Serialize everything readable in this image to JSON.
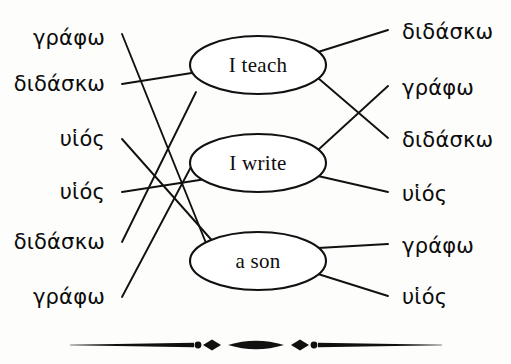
{
  "diagram": {
    "ink_color": "#111111",
    "background_color": "#fdfdfb",
    "nodes": [
      {
        "id": "teach",
        "label": "I teach",
        "cx": 258,
        "cy": 65,
        "rx": 68,
        "ry": 29
      },
      {
        "id": "write",
        "label": "I write",
        "cx": 258,
        "cy": 163,
        "rx": 68,
        "ry": 29
      },
      {
        "id": "son",
        "label": "a son",
        "cx": 258,
        "cy": 261,
        "rx": 68,
        "ry": 29
      }
    ],
    "left_words": [
      {
        "text": "γράφω",
        "x": 105,
        "y": 38
      },
      {
        "text": "διδάσκω",
        "x": 105,
        "y": 84
      },
      {
        "text": "υἱός",
        "x": 105,
        "y": 139
      },
      {
        "text": "υἱός",
        "x": 105,
        "y": 192
      },
      {
        "text": "διδάσκω",
        "x": 105,
        "y": 242
      },
      {
        "text": "γράφω",
        "x": 105,
        "y": 297
      }
    ],
    "right_words": [
      {
        "text": "διδάσκω",
        "x": 402,
        "y": 32
      },
      {
        "text": "γράφω",
        "x": 402,
        "y": 88
      },
      {
        "text": "διδάσκω",
        "x": 402,
        "y": 140
      },
      {
        "text": "υἱός",
        "x": 402,
        "y": 194
      },
      {
        "text": "γράφω",
        "x": 402,
        "y": 246
      },
      {
        "text": "υἱός",
        "x": 402,
        "y": 297
      }
    ],
    "connectors": [
      {
        "from": "left-word-1",
        "to": "node-son",
        "x1": 122,
        "y1": 34,
        "x2": 208,
        "y2": 248
      },
      {
        "from": "left-word-2",
        "to": "node-teach",
        "x1": 122,
        "y1": 84,
        "x2": 198,
        "y2": 72
      },
      {
        "from": "left-word-3",
        "to": "node-son",
        "x1": 122,
        "y1": 139,
        "x2": 216,
        "y2": 245
      },
      {
        "from": "left-word-4",
        "to": "node-write",
        "x1": 122,
        "y1": 192,
        "x2": 219,
        "y2": 177
      },
      {
        "from": "left-word-5",
        "to": "node-teach",
        "x1": 122,
        "y1": 242,
        "x2": 196,
        "y2": 92
      },
      {
        "from": "left-word-6",
        "to": "node-write",
        "x1": 122,
        "y1": 297,
        "x2": 201,
        "y2": 148
      },
      {
        "from": "node-teach",
        "to": "right-word-1",
        "x1": 318,
        "y1": 52,
        "x2": 388,
        "y2": 30
      },
      {
        "from": "node-teach",
        "to": "right-word-3",
        "x1": 318,
        "y1": 78,
        "x2": 388,
        "y2": 138
      },
      {
        "from": "node-write",
        "to": "right-word-2",
        "x1": 318,
        "y1": 150,
        "x2": 388,
        "y2": 86
      },
      {
        "from": "node-write",
        "to": "right-word-4",
        "x1": 318,
        "y1": 176,
        "x2": 388,
        "y2": 192
      },
      {
        "from": "node-son",
        "to": "right-word-5",
        "x1": 318,
        "y1": 248,
        "x2": 388,
        "y2": 244
      },
      {
        "from": "node-son",
        "to": "right-word-6",
        "x1": 318,
        "y1": 274,
        "x2": 388,
        "y2": 296
      }
    ]
  },
  "ornament": {
    "name": "decorative-rule",
    "left_x": 70,
    "right_x": 442,
    "center_y": 345,
    "color": "#101010"
  }
}
